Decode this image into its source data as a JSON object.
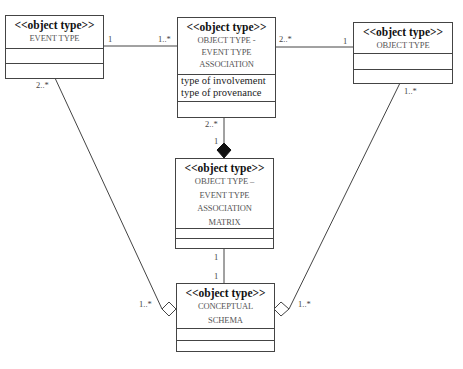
{
  "diagram": {
    "type": "UML class diagram",
    "classes": [
      {
        "id": "event_type",
        "stereotype": "<<object type>>",
        "name_lines": [
          "EVENT TYPE"
        ],
        "attributes": [],
        "operations": []
      },
      {
        "id": "ot_et_association",
        "stereotype": "<<object type>>",
        "name_lines": [
          "OBJECT TYPE -",
          "EVENT TYPE",
          "ASSOCIATION"
        ],
        "attributes": [
          "type of involvement",
          "type of provenance"
        ],
        "operations": []
      },
      {
        "id": "object_type",
        "stereotype": "<<object type>>",
        "name_lines": [
          "OBJECT TYPE"
        ],
        "attributes": [],
        "operations": []
      },
      {
        "id": "ot_et_association_matrix",
        "stereotype": "<<object type>>",
        "name_lines": [
          "OBJECT TYPE –",
          "EVENT TYPE",
          "ASSOCIATION",
          "MATRIX"
        ],
        "attributes": [],
        "operations": []
      },
      {
        "id": "conceptual_schema",
        "stereotype": "<<object type>>",
        "name_lines": [
          "CONCEPTUAL",
          "SCHEMA"
        ],
        "attributes": [],
        "operations": []
      }
    ],
    "associations": [
      {
        "from": "event_type",
        "to": "ot_et_association",
        "kind": "association",
        "from_mult": "1",
        "to_mult": "1..*"
      },
      {
        "from": "ot_et_association",
        "to": "object_type",
        "kind": "association",
        "from_mult": "2..*",
        "to_mult": "1"
      },
      {
        "from": "ot_et_association",
        "to": "ot_et_association_matrix",
        "kind": "composition",
        "from_mult": "2..*",
        "to_mult": "1"
      },
      {
        "from": "ot_et_association_matrix",
        "to": "conceptual_schema",
        "kind": "association",
        "from_mult": "1",
        "to_mult": "1"
      },
      {
        "from": "event_type",
        "to": "conceptual_schema",
        "kind": "aggregation",
        "from_mult": "2..*",
        "to_mult": "1..*"
      },
      {
        "from": "object_type",
        "to": "conceptual_schema",
        "kind": "aggregation",
        "from_mult": "1..*",
        "to_mult": "1..*"
      }
    ],
    "multiplicity_labels": {
      "et_assoc_left": "1",
      "et_assoc_right": "1..*",
      "assoc_ot_left": "2..*",
      "assoc_ot_right": "1",
      "assoc_matrix_top": "2..*",
      "assoc_matrix_bottom": "1",
      "matrix_schema_top": "1",
      "matrix_schema_bottom": "1",
      "et_schema_top": "2..*",
      "et_schema_bottom": "1..*",
      "ot_schema_top": "1..*",
      "ot_schema_bottom": "1..*"
    },
    "colors": {
      "line": "#444444",
      "text": "#333333",
      "background": "#ffffff"
    }
  }
}
